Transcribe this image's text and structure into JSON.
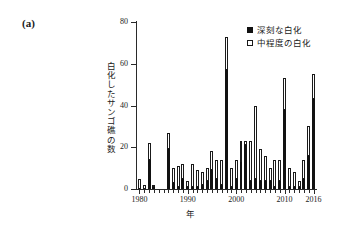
{
  "panel": {
    "label": "(a)"
  },
  "legend": {
    "position": "top-right",
    "entries": [
      {
        "marker": "filled-square-icon",
        "label": "深刻な白化"
      },
      {
        "marker": "hollow-square-icon",
        "label": "中程度の白化"
      }
    ]
  },
  "axes": {
    "y_tick_labels": [
      "0",
      "20",
      "40",
      "60",
      "80"
    ],
    "x_tick_labels": [
      "1980",
      "1990",
      "2000",
      "2010",
      "2016"
    ],
    "x_title": "年",
    "y_title": "白化したサンゴ礁の数"
  },
  "colors": {
    "severe": "#111111",
    "moderate": "#ffffff",
    "outline": "#1a1a1a",
    "axis": "#2a2a2a",
    "background": "#ffffff"
  },
  "chart_data": {
    "type": "bar",
    "stacked": true,
    "title": "",
    "subtitle": "",
    "panel_label": "(a)",
    "xlabel": "年",
    "ylabel": "白化したサンゴ礁の数",
    "xlim": [
      1979.3,
      2016.7
    ],
    "ylim": [
      0,
      80
    ],
    "ytick_interval": 20,
    "yticks": [
      0,
      20,
      40,
      60,
      80
    ],
    "xticks": [
      1980,
      1990,
      2000,
      2010,
      2016
    ],
    "grid": false,
    "legend_position": "top-right",
    "categories": [
      1980,
      1981,
      1982,
      1983,
      1984,
      1985,
      1986,
      1987,
      1988,
      1989,
      1990,
      1991,
      1992,
      1993,
      1994,
      1995,
      1996,
      1997,
      1998,
      1999,
      2000,
      2001,
      2002,
      2003,
      2004,
      2005,
      2006,
      2007,
      2008,
      2009,
      2010,
      2011,
      2012,
      2013,
      2014,
      2015,
      2016
    ],
    "series": [
      {
        "name": "深刻な白化",
        "fill": "#111111",
        "values": [
          0,
          0,
          14,
          1,
          0,
          0,
          19,
          3,
          1,
          5,
          1,
          1,
          1,
          2,
          4,
          9,
          5,
          2,
          57,
          1,
          5,
          13,
          21,
          4,
          5,
          4,
          4,
          4,
          1,
          4,
          38,
          1,
          1,
          1,
          5,
          16,
          43
        ]
      },
      {
        "name": "中程度の白化",
        "fill": "#ffffff",
        "values": [
          5,
          2,
          8,
          1,
          0,
          0,
          8,
          7,
          10,
          7,
          3,
          11,
          8,
          6,
          6,
          9,
          9,
          12,
          16,
          9,
          9,
          10,
          2,
          19,
          35,
          15,
          12,
          6,
          13,
          10,
          15,
          9,
          7,
          3,
          9,
          14,
          12
        ]
      }
    ],
    "totals": [
      5,
      2,
      22,
      2,
      0,
      0,
      27,
      10,
      11,
      12,
      4,
      12,
      9,
      8,
      10,
      18,
      14,
      14,
      73,
      10,
      14,
      23,
      23,
      23,
      40,
      19,
      16,
      10,
      14,
      14,
      53,
      10,
      8,
      4,
      14,
      30,
      55
    ]
  }
}
